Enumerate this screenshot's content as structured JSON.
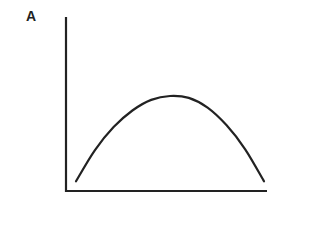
{
  "chart_data": {
    "type": "line",
    "title": "",
    "xlabel": "",
    "ylabel": "A",
    "grid": false,
    "legend": null,
    "x": [
      0,
      0.1,
      0.2,
      0.3,
      0.4,
      0.5,
      0.6,
      0.7,
      0.8,
      0.9,
      1.0
    ],
    "series": [
      {
        "name": "A",
        "values": [
          0.1,
          0.42,
          0.66,
          0.83,
          0.94,
          0.98,
          0.96,
          0.86,
          0.68,
          0.43,
          0.1
        ]
      }
    ],
    "xlim": [
      0,
      1.07
    ],
    "ylim": [
      0,
      1.0
    ],
    "curve_shape": "inverted-parabola (single peak near middle)",
    "color": "#222222"
  },
  "labels": {
    "y_axis": "A"
  }
}
